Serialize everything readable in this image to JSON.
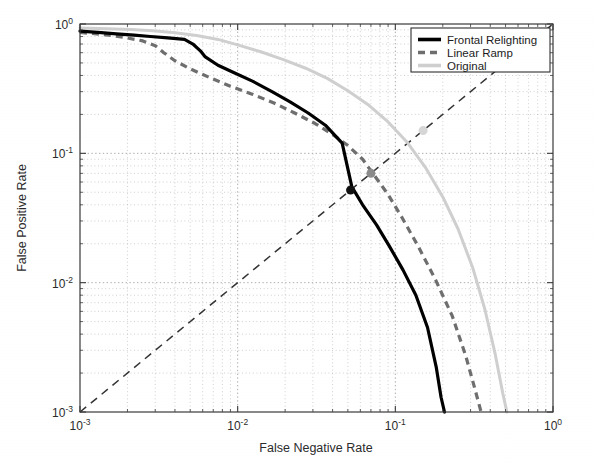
{
  "chart_data": {
    "type": "line",
    "title": "",
    "xlabel": "False Negative Rate",
    "ylabel": "False Positive Rate",
    "xscale": "log",
    "yscale": "log",
    "xlim": [
      0.001,
      1
    ],
    "ylim": [
      0.001,
      1
    ],
    "grid": true,
    "legend_position": "top-right",
    "xticks": [
      "10⁻³",
      "10⁻²",
      "10⁻¹",
      "10⁰"
    ],
    "xtick_values": [
      0.001,
      0.01,
      0.1,
      1
    ],
    "yticks": [
      "10⁻³",
      "10⁻²",
      "10⁻¹",
      "10⁰"
    ],
    "ytick_values": [
      0.001,
      0.01,
      0.1,
      1
    ],
    "series": [
      {
        "name": "Frontal Relighting",
        "style": "solid",
        "color": "#000000",
        "x": [
          0.001,
          0.0013,
          0.0017,
          0.0022,
          0.0028,
          0.0036,
          0.0046,
          0.0052,
          0.0058,
          0.0062,
          0.0075,
          0.0095,
          0.0125,
          0.0165,
          0.0215,
          0.028,
          0.036,
          0.046,
          0.053,
          0.062,
          0.076,
          0.092,
          0.112,
          0.135,
          0.16,
          0.182,
          0.195,
          0.205
        ],
        "y": [
          0.88,
          0.86,
          0.84,
          0.82,
          0.8,
          0.78,
          0.76,
          0.7,
          0.62,
          0.56,
          0.48,
          0.42,
          0.36,
          0.3,
          0.25,
          0.205,
          0.165,
          0.12,
          0.055,
          0.04,
          0.028,
          0.019,
          0.0125,
          0.008,
          0.0045,
          0.0022,
          0.0013,
          0.001
        ]
      },
      {
        "name": "Linear Ramp",
        "style": "dashed",
        "color": "#6e6e6e",
        "x": [
          0.001,
          0.0014,
          0.0019,
          0.0025,
          0.003,
          0.0034,
          0.004,
          0.005,
          0.0065,
          0.009,
          0.0125,
          0.017,
          0.023,
          0.031,
          0.04,
          0.05,
          0.062,
          0.072,
          0.09,
          0.11,
          0.14,
          0.18,
          0.23,
          0.28,
          0.32,
          0.35
        ],
        "y": [
          0.86,
          0.83,
          0.79,
          0.74,
          0.68,
          0.6,
          0.52,
          0.45,
          0.39,
          0.33,
          0.285,
          0.245,
          0.205,
          0.17,
          0.14,
          0.115,
          0.09,
          0.07,
          0.048,
          0.032,
          0.019,
          0.0105,
          0.0055,
          0.0027,
          0.0015,
          0.001
        ]
      },
      {
        "name": "Original",
        "style": "solid",
        "color": "#cfcfcf",
        "x": [
          0.001,
          0.0015,
          0.0021,
          0.0029,
          0.004,
          0.0055,
          0.0075,
          0.01,
          0.014,
          0.0195,
          0.027,
          0.037,
          0.05,
          0.068,
          0.09,
          0.12,
          0.155,
          0.2,
          0.25,
          0.31,
          0.37,
          0.43,
          0.48,
          0.51
        ],
        "y": [
          0.93,
          0.92,
          0.905,
          0.885,
          0.855,
          0.815,
          0.76,
          0.69,
          0.61,
          0.53,
          0.455,
          0.38,
          0.305,
          0.235,
          0.175,
          0.12,
          0.078,
          0.046,
          0.026,
          0.013,
          0.0062,
          0.0028,
          0.0014,
          0.001
        ]
      },
      {
        "name": "Equal Error Rate line",
        "style": "dashed-thin",
        "color": "#333333",
        "x": [
          0.001,
          1.0
        ],
        "y": [
          0.001,
          1.0
        ]
      }
    ],
    "markers": [
      {
        "name": "frontal-relighting-eer-marker",
        "x": 0.052,
        "y": 0.052,
        "color": "#111111",
        "size": 9
      },
      {
        "name": "linear-ramp-eer-marker",
        "x": 0.07,
        "y": 0.07,
        "color": "#8a8a8a",
        "size": 9
      },
      {
        "name": "original-eer-marker",
        "x": 0.15,
        "y": 0.15,
        "color": "#d6d6d6",
        "size": 9
      }
    ]
  },
  "axes": {
    "x_title": "False Negative Rate",
    "y_title": "False Positive Rate",
    "x_ticks": [
      {
        "mantissa": "10",
        "exponent": "-3"
      },
      {
        "mantissa": "10",
        "exponent": "-2"
      },
      {
        "mantissa": "10",
        "exponent": "-1"
      },
      {
        "mantissa": "10",
        "exponent": "0"
      }
    ],
    "y_ticks": [
      {
        "mantissa": "10",
        "exponent": "0"
      },
      {
        "mantissa": "10",
        "exponent": "-1"
      },
      {
        "mantissa": "10",
        "exponent": "-2"
      },
      {
        "mantissa": "10",
        "exponent": "-3"
      }
    ]
  },
  "legend": {
    "entries": [
      {
        "label": "Frontal Relighting",
        "swatch": "solid-black"
      },
      {
        "label": "Linear Ramp",
        "swatch": "dashed-gray"
      },
      {
        "label": "Original",
        "swatch": "solid-lightgray"
      }
    ]
  },
  "colors": {
    "frontal": "#000000",
    "linear": "#6e6e6e",
    "original": "#cfcfcf",
    "diagonal": "#333333",
    "frame": "#3a3a3a",
    "background": "#ffffff"
  }
}
